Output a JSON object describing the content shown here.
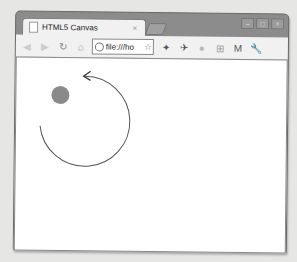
{
  "tab": {
    "title": "HTML5 Canvas",
    "close_glyph": "×"
  },
  "window_controls": {
    "minimize": "–",
    "maximize": "□",
    "close": "×"
  },
  "toolbar": {
    "back": "◀",
    "forward": "▶",
    "reload": "↻",
    "home": "⌂",
    "address": {
      "value": "file:///ho",
      "star": "☆"
    },
    "extensions": [
      {
        "name": "wand-icon",
        "glyph": "✦"
      },
      {
        "name": "plane-icon",
        "glyph": "✈"
      },
      {
        "name": "circle-icon",
        "glyph": "●"
      },
      {
        "name": "plus-box-icon",
        "glyph": "⊞"
      },
      {
        "name": "mail-icon",
        "glyph": "M"
      },
      {
        "name": "wrench-icon",
        "glyph": "🔧"
      }
    ]
  },
  "canvas": {
    "ball": {
      "cx": 44,
      "cy": 37,
      "r": 9,
      "color": "#8a8a8a"
    },
    "arc": {
      "cx": 70,
      "cy": 58,
      "r": 45,
      "stroke": "#555555"
    }
  }
}
